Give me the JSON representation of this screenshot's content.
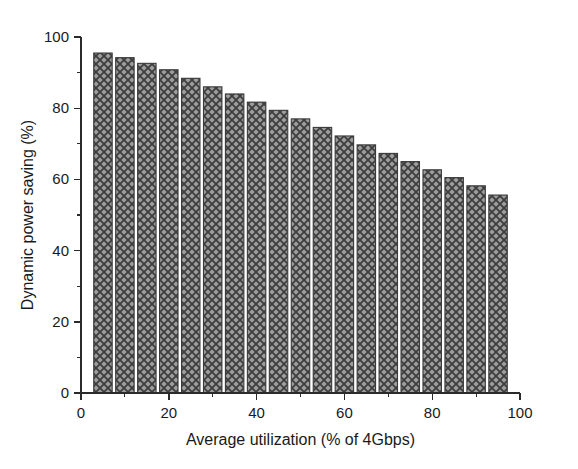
{
  "chart_data": {
    "type": "bar",
    "title": "",
    "xlabel": "Average utilization (% of 4Gbps)",
    "ylabel": "Dynamic power saving (%)",
    "xlim": [
      0,
      100
    ],
    "ylim": [
      0,
      100
    ],
    "grid": false,
    "legend": null,
    "x_major_ticks": [
      0,
      20,
      40,
      60,
      80,
      100
    ],
    "x_major_tick_labels": [
      "0",
      "20",
      "40",
      "60",
      "80",
      "100"
    ],
    "x_minor_ticks": [
      10,
      30,
      50,
      70,
      90
    ],
    "y_major_ticks": [
      0,
      20,
      40,
      60,
      80,
      100
    ],
    "y_major_tick_labels": [
      "0",
      "20",
      "40",
      "60",
      "80",
      "100"
    ],
    "y_minor_ticks": [
      10,
      30,
      50,
      70,
      90
    ],
    "bar_width": 4.2,
    "bar_fill": "#9a9a9a",
    "bar_edge": "#3a3a3a",
    "bar_pattern": "crosshatch",
    "categories": [
      5,
      10,
      15,
      20,
      25,
      30,
      35,
      40,
      45,
      50,
      55,
      60,
      65,
      70,
      75,
      80,
      85,
      90,
      95
    ],
    "values": [
      95.5,
      94.2,
      92.6,
      90.8,
      88.4,
      86.0,
      84.0,
      81.7,
      79.4,
      77.0,
      74.6,
      72.2,
      69.7,
      67.3,
      65.0,
      62.7,
      60.5,
      58.2,
      55.6
    ]
  },
  "figure": {
    "background": "#ffffff",
    "axis_color": "#2b2b2b"
  }
}
